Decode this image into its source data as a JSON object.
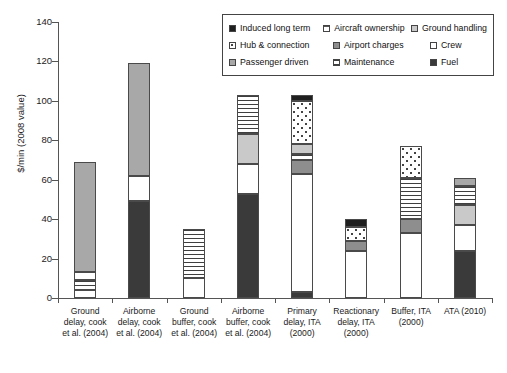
{
  "chart_data": {
    "type": "bar",
    "stacked": true,
    "title": "",
    "xlabel": "",
    "ylabel": "$/min (2008 value)",
    "ylim": [
      0,
      140
    ],
    "yticks": [
      0,
      20,
      40,
      60,
      80,
      100,
      120,
      140
    ],
    "grid": false,
    "legend_position": "top-right",
    "categories": [
      "Ground delay, cook et al. (2004)",
      "Airborne delay, cook et al. (2004)",
      "Ground buffer, cook et al. (2004)",
      "Airborne buffer, cook et al. (2004)",
      "Primary delay, ITA (2000)",
      "Reactionary delay, ITA (2000)",
      "Buffer, ITA (2000)",
      "ATA (2010)"
    ],
    "category_lines": [
      [
        "Ground",
        "delay, cook",
        "et al. (2004)"
      ],
      [
        "Airborne",
        "delay, cook",
        "et al. (2004)"
      ],
      [
        "Ground",
        "buffer, cook",
        "et al. (2004)"
      ],
      [
        "Airborne",
        "buffer, cook",
        "et al. (2004)"
      ],
      [
        "Primary",
        "delay, ITA",
        "(2000)"
      ],
      [
        "Reactionary",
        "delay, ITA",
        "(2000)"
      ],
      [
        "Buffer, ITA",
        "(2000)",
        ""
      ],
      [
        "ATA (2010)",
        "",
        ""
      ]
    ],
    "series": [
      {
        "name": "Fuel",
        "key": "fuel",
        "values": [
          0,
          49,
          0,
          53,
          3,
          0,
          0,
          24
        ]
      },
      {
        "name": "Crew",
        "key": "crew",
        "values": [
          0,
          13,
          10,
          15,
          60,
          0,
          33,
          13
        ]
      },
      {
        "name": "Maintenance",
        "key": "maint",
        "values": [
          4,
          0,
          25,
          0,
          3,
          0,
          21,
          10
        ]
      },
      {
        "name": "Airport charges",
        "key": "airport",
        "values": [
          0,
          0,
          0,
          0,
          7,
          5,
          7,
          0
        ]
      },
      {
        "name": "Ground handling",
        "key": "ground",
        "values": [
          0,
          0,
          0,
          15,
          5,
          0,
          0,
          10
        ]
      },
      {
        "name": "Passenger driven",
        "key": "pass",
        "values": [
          55,
          57,
          0,
          20,
          0,
          0,
          0,
          4
        ]
      },
      {
        "name": "Hub & connection",
        "key": "hub",
        "values": [
          0,
          0,
          0,
          0,
          22,
          31,
          16,
          0
        ]
      },
      {
        "name": "Induced long term",
        "key": "induced",
        "values": [
          0,
          0,
          0,
          0,
          3,
          4,
          0,
          0
        ]
      },
      {
        "name": "Aircraft ownership",
        "key": "aircraft",
        "values": [
          10,
          0,
          0,
          0,
          0,
          0,
          0,
          0
        ]
      }
    ],
    "totals": [
      69,
      119,
      35,
      103,
      103,
      40,
      77,
      61
    ],
    "bars": [
      {
        "label": "Ground delay, cook et al. (2004)",
        "segments": [
          {
            "key": "crew",
            "name": "Crew",
            "from": 0,
            "to": 4
          },
          {
            "key": "maint",
            "name": "Maintenance",
            "from": 4,
            "to": 9
          },
          {
            "key": "crew2",
            "name": "Crew",
            "from": 9,
            "to": 13
          },
          {
            "key": "pass",
            "name": "Passenger driven",
            "from": 13,
            "to": 69
          }
        ]
      },
      {
        "label": "Airborne delay, cook et al. (2004)",
        "segments": [
          {
            "key": "fuel",
            "name": "Fuel",
            "from": 0,
            "to": 49
          },
          {
            "key": "crew",
            "name": "Crew",
            "from": 49,
            "to": 62
          },
          {
            "key": "pass",
            "name": "Passenger driven",
            "from": 62,
            "to": 119
          }
        ]
      },
      {
        "label": "Ground buffer, cook et al. (2004)",
        "segments": [
          {
            "key": "crew",
            "name": "Crew",
            "from": 0,
            "to": 10
          },
          {
            "key": "maint",
            "name": "Maintenance",
            "from": 10,
            "to": 35
          }
        ]
      },
      {
        "label": "Airborne buffer, cook et al. (2004)",
        "segments": [
          {
            "key": "fuel",
            "name": "Fuel",
            "from": 0,
            "to": 53
          },
          {
            "key": "crew",
            "name": "Crew",
            "from": 53,
            "to": 68
          },
          {
            "key": "ground",
            "name": "Ground handling",
            "from": 68,
            "to": 83
          },
          {
            "key": "maint",
            "name": "Maintenance",
            "from": 83,
            "to": 103
          }
        ]
      },
      {
        "label": "Primary delay, ITA (2000)",
        "segments": [
          {
            "key": "fuel",
            "name": "Fuel",
            "from": 0,
            "to": 3
          },
          {
            "key": "crew",
            "name": "Crew",
            "from": 3,
            "to": 63
          },
          {
            "key": "airport",
            "name": "Airport charges",
            "from": 63,
            "to": 70
          },
          {
            "key": "maint",
            "name": "Maintenance",
            "from": 70,
            "to": 73
          },
          {
            "key": "ground",
            "name": "Ground handling",
            "from": 73,
            "to": 78
          },
          {
            "key": "hub",
            "name": "Hub & connection",
            "from": 78,
            "to": 100
          },
          {
            "key": "induced",
            "name": "Induced long term",
            "from": 100,
            "to": 103
          }
        ]
      },
      {
        "label": "Reactionary delay, ITA (2000)",
        "segments": [
          {
            "key": "crew",
            "name": "Crew",
            "from": 0,
            "to": 24
          },
          {
            "key": "airport",
            "name": "Airport charges",
            "from": 24,
            "to": 29
          },
          {
            "key": "hub",
            "name": "Hub & connection",
            "from": 29,
            "to": 36
          },
          {
            "key": "induced",
            "name": "Induced long term",
            "from": 36,
            "to": 40
          }
        ]
      },
      {
        "label": "Buffer, ITA (2000)",
        "segments": [
          {
            "key": "crew",
            "name": "Crew",
            "from": 0,
            "to": 33
          },
          {
            "key": "airport",
            "name": "Airport charges",
            "from": 33,
            "to": 40
          },
          {
            "key": "maint",
            "name": "Maintenance",
            "from": 40,
            "to": 61
          },
          {
            "key": "hub",
            "name": "Hub & connection",
            "from": 61,
            "to": 77
          }
        ]
      },
      {
        "label": "ATA (2010)",
        "segments": [
          {
            "key": "fuel",
            "name": "Fuel",
            "from": 0,
            "to": 24
          },
          {
            "key": "crew",
            "name": "Crew",
            "from": 24,
            "to": 37
          },
          {
            "key": "ground",
            "name": "Ground handling",
            "from": 37,
            "to": 47
          },
          {
            "key": "maint",
            "name": "Maintenance",
            "from": 47,
            "to": 57
          },
          {
            "key": "pass",
            "name": "Passenger driven",
            "from": 57,
            "to": 61
          }
        ]
      }
    ]
  },
  "legend": {
    "rows": [
      [
        {
          "label": "Induced long term",
          "key": "induced"
        },
        {
          "label": "Aircraft ownership",
          "key": "aircraft"
        },
        {
          "label": "Ground handling",
          "key": "ground"
        }
      ],
      [
        {
          "label": "Hub & connection",
          "key": "hub"
        },
        {
          "label": "Airport charges",
          "key": "airport"
        },
        {
          "label": "Crew",
          "key": "crew"
        }
      ],
      [
        {
          "label": "Passenger driven",
          "key": "pass"
        },
        {
          "label": "Maintenance",
          "key": "maint"
        },
        {
          "label": "Fuel",
          "key": "fuel"
        }
      ]
    ]
  },
  "colors": {
    "induced": "#1f1f1f",
    "fuel": "#3a3a3a",
    "airport": "#8e8e8e",
    "pass": "#a8a8a8",
    "ground": "#c9c9c9",
    "crew": "#ffffff",
    "axis": "#555555"
  }
}
